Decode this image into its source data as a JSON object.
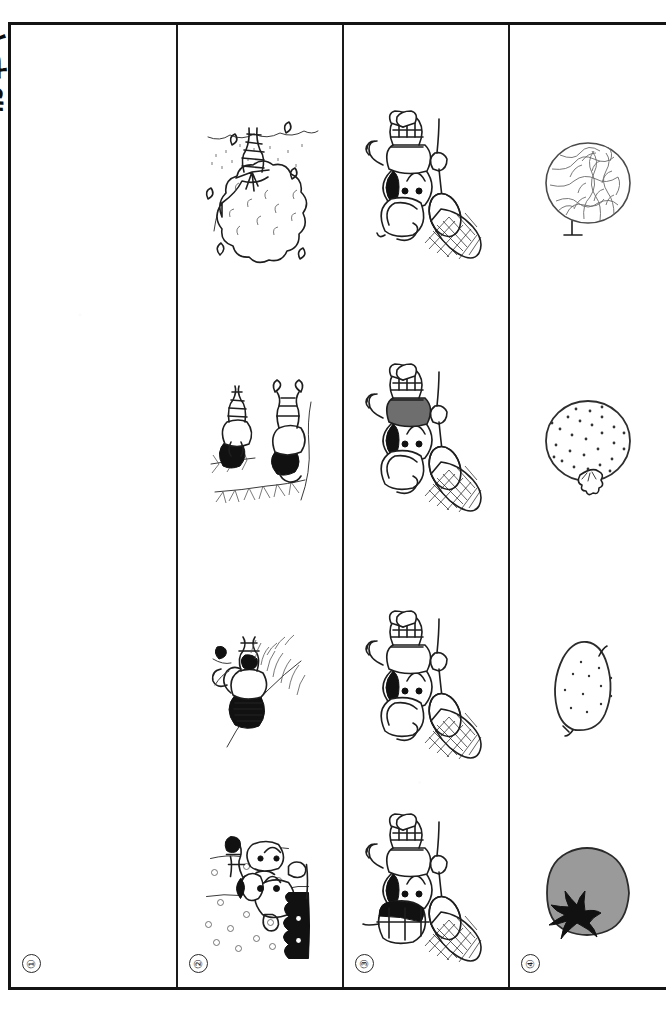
{
  "document": {
    "type": "worksheet-page",
    "orientation": "rotated-90-ccw",
    "edge_caption": "きせつ",
    "page_background": "#ffffff",
    "rule_color": "#141414"
  },
  "grid": {
    "column_count": 4,
    "row_count": 4,
    "columns": [
      {
        "index_label": "①",
        "name": "answer-column",
        "content_type": "blank",
        "cells": [
          {
            "row": 1,
            "content": "blank"
          },
          {
            "row": 2,
            "content": "blank"
          },
          {
            "row": 3,
            "content": "blank"
          },
          {
            "row": 4,
            "content": "blank"
          }
        ]
      },
      {
        "index_label": "②",
        "name": "season-scene-column",
        "content_type": "illustration",
        "cells": [
          {
            "row": 1,
            "icon": "cherry-blossom-tree-illustration",
            "season": "spring"
          },
          {
            "row": 2,
            "icon": "children-bamboo-illustration",
            "season": "summer"
          },
          {
            "row": 3,
            "icon": "child-autumn-leaves-illustration",
            "season": "autumn"
          },
          {
            "row": 4,
            "icon": "snowman-child-illustration",
            "season": "winter"
          }
        ]
      },
      {
        "index_label": "③",
        "name": "child-with-net-column",
        "content_type": "illustration",
        "cells": [
          {
            "row": 1,
            "icon": "child-with-net-white-shirt-illustration",
            "shirt_color": "#ffffff",
            "hat": "straw-hat"
          },
          {
            "row": 2,
            "icon": "child-with-net-gray-shirt-illustration",
            "shirt_color": "#6e6e6e",
            "hat": "straw-hat"
          },
          {
            "row": 3,
            "icon": "child-with-net-white-shirt-illustration",
            "shirt_color": "#ffffff",
            "hat": "straw-hat"
          },
          {
            "row": 4,
            "icon": "child-with-net-capped-illustration",
            "shirt_color": "#ffffff",
            "hat": "half-black-cap"
          }
        ]
      },
      {
        "index_label": "④",
        "name": "fruit-column",
        "content_type": "illustration",
        "cells": [
          {
            "row": 1,
            "icon": "melon-illustration",
            "fill": "#ffffff"
          },
          {
            "row": 2,
            "icon": "speckled-fruit-illustration",
            "fill": "#ffffff"
          },
          {
            "row": 3,
            "icon": "lemon-illustration",
            "fill": "#ffffff"
          },
          {
            "row": 4,
            "icon": "tomato-illustration",
            "fill": "#9a9a9a"
          }
        ]
      }
    ]
  }
}
